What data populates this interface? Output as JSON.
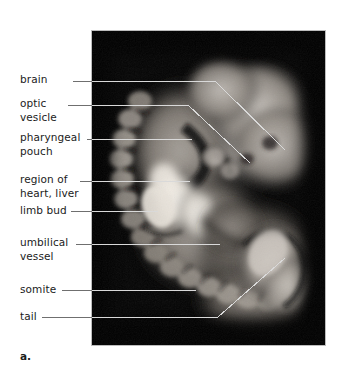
{
  "figure": {
    "caption_label": "a.",
    "photo": {
      "subject": "mammalian-embryo-micrograph",
      "background_color": "#000000",
      "border_color": "#bdbdbd",
      "leader_line_color": "#d8d8d8"
    },
    "labels": [
      {
        "id": "brain",
        "text": "brain",
        "text_x": 20,
        "text_y": 78,
        "lines": 1,
        "leader": [
          [
            73,
            81
          ],
          [
            215,
            81
          ],
          [
            285,
            150
          ]
        ]
      },
      {
        "id": "optic-vesicle",
        "text": "optic\nvesicle",
        "text_x": 20,
        "text_y": 100,
        "lines": 2,
        "leader": [
          [
            68,
            105
          ],
          [
            188,
            105
          ],
          [
            250,
            163
          ]
        ]
      },
      {
        "id": "pharyngeal-pouch",
        "text": "pharyngeal\npouch",
        "text_x": 20,
        "text_y": 134,
        "lines": 2,
        "leader": [
          [
            87,
            139
          ],
          [
            192,
            139
          ]
        ]
      },
      {
        "id": "region-of-heart-liver",
        "text": "region of\nheart, liver",
        "text_x": 20,
        "text_y": 176,
        "lines": 2,
        "leader": [
          [
            80,
            181
          ],
          [
            190,
            181
          ]
        ]
      },
      {
        "id": "limb-bud",
        "text": "limb bud",
        "text_x": 20,
        "text_y": 207,
        "lines": 1,
        "leader": [
          [
            71,
            211
          ],
          [
            158,
            211
          ]
        ]
      },
      {
        "id": "umbilical-vessel",
        "text": "umbilical\nvessel",
        "text_x": 20,
        "text_y": 240,
        "lines": 2,
        "leader": [
          [
            76,
            244
          ],
          [
            220,
            244
          ]
        ]
      },
      {
        "id": "somite",
        "text": "somite",
        "text_x": 20,
        "text_y": 286,
        "lines": 1,
        "leader": [
          [
            62,
            290
          ],
          [
            196,
            290
          ]
        ]
      },
      {
        "id": "tail",
        "text": "tail",
        "text_x": 20,
        "text_y": 313,
        "lines": 1,
        "leader": [
          [
            42,
            317
          ],
          [
            218,
            317
          ],
          [
            285,
            258
          ]
        ]
      }
    ]
  }
}
